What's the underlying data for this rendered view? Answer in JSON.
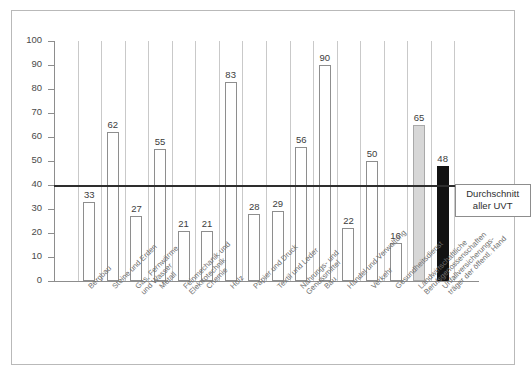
{
  "chart_data": {
    "type": "bar",
    "title": "",
    "xlabel": "",
    "ylabel": "",
    "ylim": [
      0,
      100
    ],
    "ytick_labels": [
      "100",
      "90",
      "80",
      "70",
      "60",
      "50",
      "40",
      "30",
      "20",
      "10",
      "0"
    ],
    "ytick_values": [
      100,
      90,
      80,
      70,
      60,
      50,
      40,
      30,
      20,
      10,
      0
    ],
    "grid": "vertical category separators only",
    "legend": "none",
    "categories": [
      "Bergbau",
      "Steine und Erden",
      "Gas, Fernwärme und Wasser",
      "Metall",
      "Feinmechanik und Elektrotechnik",
      "Chemie",
      "Holz",
      "Papier und Druck",
      "Textil und Leder",
      "Nahrungs- und Genussmittel",
      "Bau",
      "Handel und Verwaltung",
      "Verkehr",
      "Gesundheitsdienst",
      "Landwirtschaftliche Berufsgenossenschaften",
      "Unfallversicherungsträger der öffentl. Hand"
    ],
    "category_lines": [
      [
        "Bergbau"
      ],
      [
        "Steine und Erden"
      ],
      [
        "Gas, Fernwärme",
        "und Wasser"
      ],
      [
        "Metall"
      ],
      [
        "Feinmechanik und",
        "Elektrotechnik"
      ],
      [
        "Chemie"
      ],
      [
        "Holz"
      ],
      [
        "Papier und Druck"
      ],
      [
        "Textil und Leder"
      ],
      [
        "Nahrungs- und",
        "Genussmittel"
      ],
      [
        "Bau"
      ],
      [
        "Handel und Verwaltung"
      ],
      [
        "Verkehr"
      ],
      [
        "Gesundheitsdienst"
      ],
      [
        "Landwirtschaftliche",
        "Berufsgenossenschaften"
      ],
      [
        "Unfallversicherungs-",
        "träger der öffentl. Hand"
      ]
    ],
    "values": [
      33,
      62,
      27,
      55,
      21,
      21,
      83,
      28,
      29,
      56,
      90,
      22,
      50,
      16,
      65,
      48
    ],
    "bar_styles": [
      "open",
      "open",
      "open",
      "open",
      "open",
      "open",
      "open",
      "open",
      "open",
      "open",
      "open",
      "open",
      "open",
      "open",
      "gray",
      "black"
    ],
    "reference_line": {
      "value": 40,
      "label_line1": "Durchschnitt",
      "label_line2": "aller UVT"
    }
  },
  "colors": {
    "frame_border": "#b9b9b9",
    "axis": "#8d8d8d",
    "gridline": "#c9c9c9",
    "bar_open_fill": "#ffffff",
    "bar_open_border": "#8e8e8e",
    "bar_gray_fill": "#d7d7d7",
    "bar_black_fill": "#121212",
    "reference_line": "#2e2e2e",
    "tick_text": "#4a4a4a",
    "category_text": "#6e6e6e",
    "value_text": "#3c3c3c"
  }
}
